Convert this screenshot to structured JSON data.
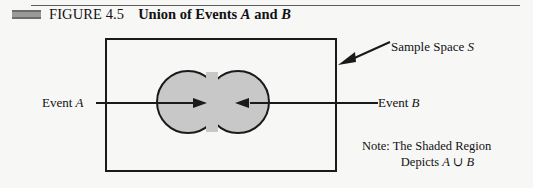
{
  "header": {
    "figure_number": "FIGURE 4.5",
    "title_parts": [
      {
        "text": "Union of Events ",
        "style": "bold"
      },
      {
        "text": "A",
        "style": "bold-italic"
      },
      {
        "text": " and ",
        "style": "bold"
      },
      {
        "text": "B",
        "style": "bold-italic"
      }
    ],
    "title_plain": "Union of Events A and B",
    "bar_color": "#9a9a9a"
  },
  "diagram": {
    "sample_space": {
      "label_prefix": "Sample Space ",
      "label_symbol": "S",
      "border_color": "#1a1a1a"
    },
    "events": [
      {
        "label_prefix": "Event ",
        "label_symbol": "A",
        "fill_color": "#c8c8c8",
        "arrow_direction": "right"
      },
      {
        "label_prefix": "Event ",
        "label_symbol": "B",
        "fill_color": "#c8c8c8",
        "arrow_direction": "left"
      }
    ],
    "note": {
      "line1": "Note: The Shaded Region",
      "line2_prefix": "Depicts ",
      "line2_a": "A",
      "line2_operator": " ∪ ",
      "line2_b": "B"
    }
  },
  "colors": {
    "background": "#f7f7f6",
    "ink": "#1a1a1a",
    "shade": "#c8c8c8",
    "rule": "#5c5c5c"
  }
}
